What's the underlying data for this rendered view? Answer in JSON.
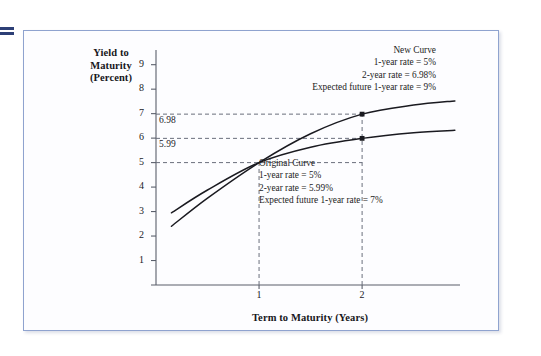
{
  "figure": {
    "edge_marker": "page-edge-rule-mark"
  },
  "chart_data": {
    "type": "line",
    "title": "",
    "xlabel": "Term to Maturity (Years)",
    "ylabel": "Yield to Maturity (Percent)",
    "ylabel_lines": [
      "Yield to",
      "Maturity",
      "(Percent)"
    ],
    "xlim": [
      0,
      2.95
    ],
    "ylim": [
      0,
      9.6
    ],
    "grid": false,
    "legend_position": "inline-annotations",
    "yticks": [
      9,
      8,
      7,
      6,
      5,
      4,
      3,
      2,
      1
    ],
    "ytick_labels": [
      "9",
      "8",
      "7",
      "6",
      "5",
      "4",
      "3",
      "2",
      "1"
    ],
    "xticks": [
      1,
      2
    ],
    "xtick_labels": [
      "1",
      "2"
    ],
    "series": [
      {
        "name": "New Curve",
        "points": [
          {
            "x": 0.15,
            "y": 2.4
          },
          {
            "x": 0.5,
            "y": 3.55
          },
          {
            "x": 1.0,
            "y": 5.0
          },
          {
            "x": 1.5,
            "y": 6.18
          },
          {
            "x": 2.0,
            "y": 6.98
          },
          {
            "x": 2.5,
            "y": 7.35
          },
          {
            "x": 2.9,
            "y": 7.52
          }
        ]
      },
      {
        "name": "Original Curve",
        "points": [
          {
            "x": 0.15,
            "y": 2.95
          },
          {
            "x": 0.5,
            "y": 3.88
          },
          {
            "x": 1.0,
            "y": 5.0
          },
          {
            "x": 1.5,
            "y": 5.63
          },
          {
            "x": 2.0,
            "y": 5.99
          },
          {
            "x": 2.5,
            "y": 6.22
          },
          {
            "x": 2.9,
            "y": 6.32
          }
        ]
      }
    ],
    "markers": [
      {
        "x": 2,
        "y": 6.98,
        "series": "New Curve"
      },
      {
        "x": 2,
        "y": 5.99,
        "series": "Original Curve"
      }
    ],
    "reference_lines": [
      {
        "orientation": "horizontal",
        "value": 6.98,
        "label": "6.98",
        "style": "dashed"
      },
      {
        "orientation": "horizontal",
        "value": 5.99,
        "label": "5.99",
        "style": "dashed"
      },
      {
        "orientation": "horizontal",
        "value": 5.0,
        "label": "",
        "style": "dashed"
      },
      {
        "orientation": "vertical",
        "value": 1,
        "label": "",
        "style": "dashed"
      },
      {
        "orientation": "vertical",
        "value": 2,
        "label": "",
        "style": "dashed"
      }
    ],
    "value_labels": [
      "6.98",
      "5.99"
    ],
    "annotations": [
      {
        "name": "New Curve",
        "align": "right",
        "lines": [
          "New Curve",
          "1-year rate = 5%",
          "2-year rate = 6.98%",
          "Expected future 1-year rate = 9%"
        ]
      },
      {
        "name": "Original Curve",
        "align": "left",
        "lines": [
          "Original Curve",
          "1-year rate = 5%",
          "2-year rate = 5.99%",
          "Expected future 1-year rate = 7%"
        ]
      }
    ],
    "colors": {
      "curve": "#1a1a20",
      "axis": "#5a5f6b",
      "dashed": "#6a6f7c",
      "frame_border": "#8fa3cf",
      "text": "#1a1a1f",
      "edge_marker": "#2d3f76"
    }
  }
}
